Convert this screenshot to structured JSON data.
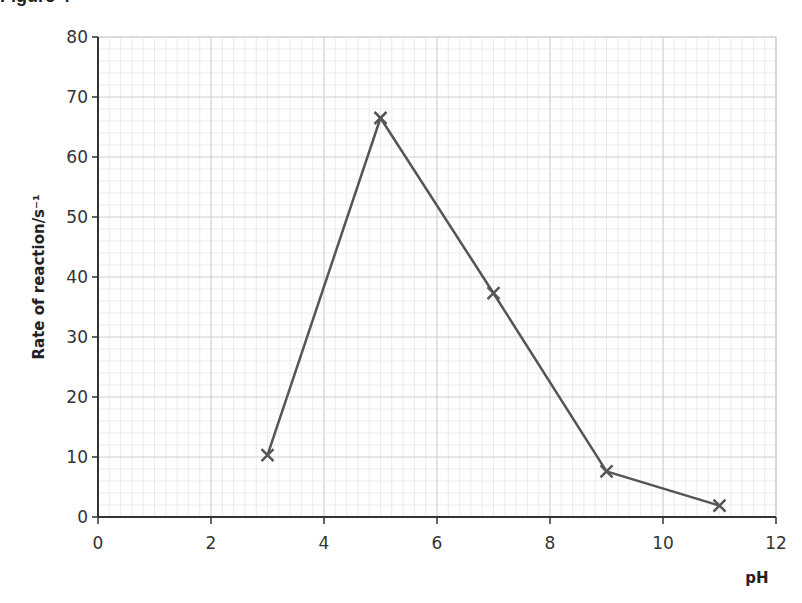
{
  "header": {
    "text": "Figure 4"
  },
  "chart_data": {
    "type": "line",
    "title": "",
    "xlabel": "pH",
    "ylabel": "Rate of reaction/s⁻¹",
    "x": [
      3,
      5,
      7,
      9,
      11
    ],
    "series": [
      {
        "name": "Rate of reaction",
        "values": [
          10.3,
          66.5,
          37.3,
          7.6,
          1.9
        ],
        "marker": "x",
        "color": "#555555"
      }
    ],
    "xlim": [
      0,
      12
    ],
    "ylim": [
      0,
      80
    ],
    "xticks": [
      0,
      2,
      4,
      6,
      8,
      10,
      12
    ],
    "yticks": [
      0,
      10,
      20,
      30,
      40,
      50,
      60,
      70,
      80
    ],
    "grid": true,
    "grid_style": "graph paper (major every 2 units x / 10 units y, minor subdivisions)",
    "legend": null
  },
  "colors": {
    "line": "#555555",
    "grid_minor": "#e4e4e4",
    "grid_major": "#cfcfcf",
    "axis": "#333333"
  }
}
